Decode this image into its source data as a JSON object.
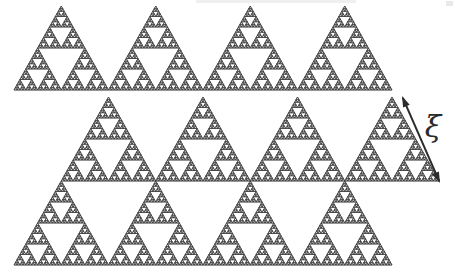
{
  "figure": {
    "background_color": "#ffffff",
    "width": 455,
    "height": 278
  },
  "fractal": {
    "name": "sierpinski-gasket",
    "stroke_color": "#3a3a3a",
    "fill_color": "#ffffff",
    "recursion_depth": 5,
    "rows": 3,
    "columns_per_row": 4,
    "cell_width": 94.5,
    "cell_height": 84,
    "row_offsets": [
      14,
      61.25,
      14
    ],
    "row_tops": [
      6,
      97,
      181
    ],
    "row_orientation": [
      "up",
      "up",
      "up"
    ],
    "interstitial_orientation": "down",
    "description": "Three rows of upward-pointing Sierpinski triangles; the middle row is offset by half a cell so the gaps form downward-pointing triangles."
  },
  "annotation": {
    "label": "ξ",
    "label_name": "xi",
    "label_meaning": "correlation-length",
    "label_x": 433,
    "label_y": 127,
    "label_font_size": 30,
    "label_rotation": 0,
    "arrow": {
      "name": "double-headed-arrow",
      "x1": 402,
      "y1": 96,
      "x2": 440,
      "y2": 183,
      "stroke_color": "#2b2b2b",
      "stroke_width": 2,
      "heads": "both"
    }
  },
  "artifacts": {
    "top_strip_color": "#efefef",
    "corner_mark_color": "#e9e9e9"
  }
}
